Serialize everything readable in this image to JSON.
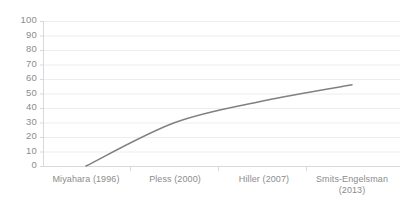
{
  "chart_data": {
    "type": "line",
    "title": "",
    "subtitle": "",
    "xlabel": "",
    "ylabel": "",
    "categories": [
      "Miyahara (1996)",
      "Pless (2000)",
      "Hiller (2007)",
      "Smits-Engelsman (2013)"
    ],
    "values": [
      0,
      30,
      45,
      56
    ],
    "series": [
      {
        "name": "",
        "values": [
          0,
          30,
          45,
          56
        ],
        "color": "#808080",
        "smooth": true,
        "markers": false,
        "line_width": 1.5
      }
    ],
    "ylim": [
      0,
      100
    ],
    "ytick_labels": [
      "100",
      "90",
      "80",
      "70",
      "60",
      "50",
      "40",
      "30",
      "20",
      "10",
      "0"
    ],
    "ytick_values": [
      100,
      90,
      80,
      70,
      60,
      50,
      40,
      30,
      20,
      10,
      0
    ],
    "grid": {
      "horizontal": true,
      "vertical": false,
      "color": "#ededed"
    },
    "axis": {
      "line_color": "#d9d9d9",
      "tick_color": "#d9d9d9",
      "category_separators": true
    },
    "legend": {
      "visible": false,
      "position": "none"
    },
    "text_color": "#8c8c8c",
    "background": "#ffffff"
  },
  "plot_geometry": {
    "left": 43,
    "right": 400,
    "top": 21,
    "bottom": 166,
    "point_x": [
      86,
      175,
      264,
      352
    ],
    "separator_x": [
      130,
      218,
      306
    ]
  }
}
